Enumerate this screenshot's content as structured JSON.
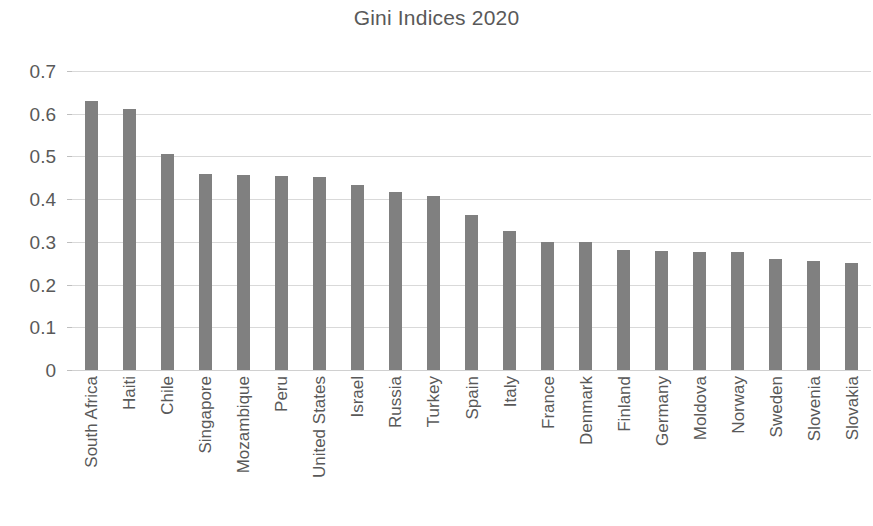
{
  "chart_data": {
    "type": "bar",
    "title": "Gini Indices 2020",
    "xlabel": "",
    "ylabel": "",
    "ylim": [
      0,
      0.7
    ],
    "yticks": [
      "0",
      "0.1",
      "0.2",
      "0.3",
      "0.4",
      "0.5",
      "0.6",
      "0.7"
    ],
    "ytick_values": [
      0,
      0.1,
      0.2,
      0.3,
      0.4,
      0.5,
      0.6,
      0.7
    ],
    "grid": true,
    "legend": false,
    "bar_color": "#808080",
    "text_color": "#595959",
    "gridline_color": "#d9d9d9",
    "background_color": "#ffffff",
    "categories": [
      "South Africa",
      "Haiti",
      "Chile",
      "Singapore",
      "Mozambique",
      "Peru",
      "United States",
      "Israel",
      "Russia",
      "Turkey",
      "Spain",
      "Italy",
      "France",
      "Denmark",
      "Finland",
      "Germany",
      "Moldova",
      "Norway",
      "Sweden",
      "Slovenia",
      "Slovakia"
    ],
    "values": [
      0.63,
      0.61,
      0.505,
      0.459,
      0.456,
      0.454,
      0.452,
      0.433,
      0.417,
      0.408,
      0.363,
      0.325,
      0.3,
      0.299,
      0.281,
      0.279,
      0.277,
      0.277,
      0.259,
      0.255,
      0.25
    ]
  }
}
